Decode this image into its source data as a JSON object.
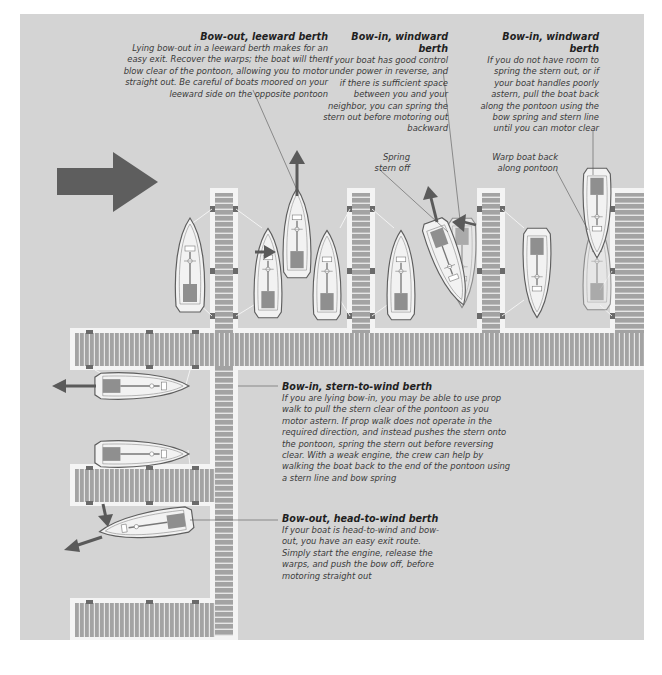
{
  "colors": {
    "panel": "#d4d4d4",
    "pontoon_border": "#f4f4f4",
    "plank": "#9a9a9a",
    "water": "#d4d4d4",
    "arrow": "#5a5a5a",
    "hull_fill": "#f0f0f0",
    "hull_tint": "#b8b8b8",
    "deck_box": "#8c8c8c",
    "leader_line": "#555555"
  },
  "captions": {
    "bow_out_leeward": {
      "title": "Bow-out, leeward berth",
      "body": "Lying bow-out in a leeward berth makes for an easy exit. Recover the warps; the boat will then blow clear of the pontoon, allowing you to motor straight out. Be careful of boats moored on your leeward side on the opposite pontoon"
    },
    "bow_in_windward_spring": {
      "title": "Bow-in, windward berth",
      "body": "If your boat has good control under power in reverse, and if there is sufficient space between you and your neighbor, you can spring the stern out before motoring out backward"
    },
    "bow_in_windward_warp": {
      "title": "Bow-in, windward berth",
      "body": "If you do not have room to spring the stern out, or if your boat handles poorly astern, pull the boat back along the pontoon using the bow spring and stern line until you can motor clear"
    },
    "bow_in_stern_to_wind": {
      "title": "Bow-in, stern-to-wind berth",
      "body": "If you are lying bow-in, you may be able to use prop walk to pull the stern clear of the pontoon as you motor astern. If prop walk does not operate in the required direction, and instead pushes the stern onto the pontoon, spring the stern out before reversing clear. With a weak engine, the crew can help by walking the boat back to the end of the pontoon using a stern line and bow spring"
    },
    "bow_out_head_to_wind": {
      "title": "Bow-out, head-to-wind berth",
      "body": "If your boat is head-to-wind and bow-out, you have an easy exit route. Simply start the engine, release the warps, and push the bow off, before motoring straight out"
    }
  },
  "labels": {
    "spring_stern_off": "Spring stern off",
    "warp_boat_back": "Warp boat back along pontoon"
  },
  "icons": {
    "wind_direction": "wind-arrow-icon",
    "motion_arrow": "motion-arrow-icon"
  }
}
